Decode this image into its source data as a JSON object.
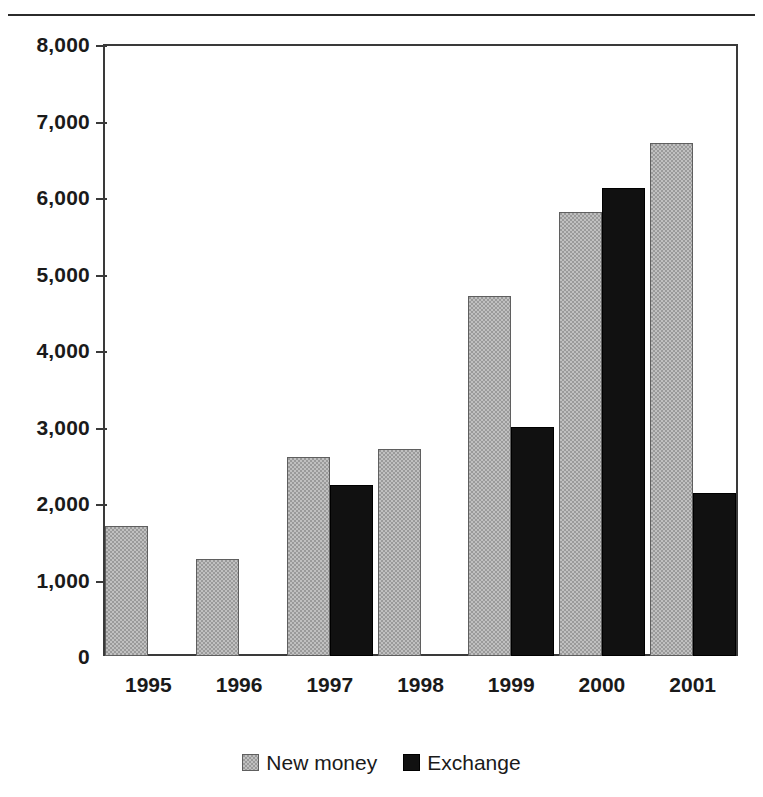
{
  "chart_data": {
    "type": "bar",
    "title": "",
    "subtitle": "",
    "xlabel": "",
    "ylabel": "",
    "categories": [
      "1995",
      "1996",
      "1997",
      "1998",
      "1999",
      "2000",
      "2001"
    ],
    "series": [
      {
        "name": "New money",
        "color": "#9a9a9a",
        "values": [
          1700,
          1270,
          2600,
          2700,
          4700,
          5800,
          6700
        ]
      },
      {
        "name": "Exchange",
        "color": "#111111",
        "values": [
          0,
          0,
          2240,
          0,
          3000,
          6120,
          2130
        ]
      }
    ],
    "ylim": [
      0,
      8000
    ],
    "ytick_values": [
      0,
      1000,
      2000,
      3000,
      4000,
      5000,
      6000,
      7000,
      8000
    ],
    "ytick_labels": [
      "0",
      "1,000",
      "2,000",
      "3,000",
      "4,000",
      "5,000",
      "6,000",
      "7,000",
      "8,000"
    ],
    "grid": false,
    "legend_position": "bottom-center",
    "legend_entries": [
      "New money",
      "Exchange"
    ]
  },
  "figure": {
    "top_rule": "horizontal-rule"
  }
}
